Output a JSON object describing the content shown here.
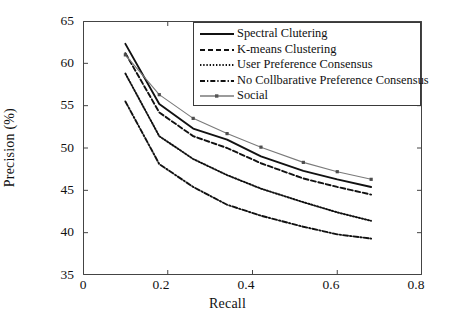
{
  "chart_data": {
    "type": "line",
    "title": "",
    "xlabel": "Recall",
    "ylabel": "Precision (%)",
    "xlim": [
      0,
      0.8
    ],
    "ylim": [
      35,
      65
    ],
    "xticks": [
      "0",
      "0.2",
      "0.4",
      "0.6",
      "0.8"
    ],
    "xtick_values": [
      0,
      0.2,
      0.4,
      0.6,
      0.8
    ],
    "yticks": [
      "35",
      "40",
      "45",
      "50",
      "55",
      "60",
      "65"
    ],
    "ytick_values": [
      35,
      40,
      45,
      50,
      55,
      60,
      65
    ],
    "grid": false,
    "legend_position": "top-right",
    "series": [
      {
        "name": "Spectral Clutering",
        "style": "solid",
        "color": "#111111",
        "x": [
          0.1,
          0.18,
          0.26,
          0.34,
          0.42,
          0.52,
          0.6,
          0.68
        ],
        "y": [
          62.3,
          55.2,
          52.3,
          51.0,
          49.0,
          47.3,
          46.3,
          45.4
        ]
      },
      {
        "name": "K-means Clustering",
        "style": "dashed",
        "color": "#111111",
        "x": [
          0.1,
          0.18,
          0.26,
          0.34,
          0.42,
          0.52,
          0.6,
          0.68
        ],
        "y": [
          61.2,
          54.2,
          51.4,
          50.0,
          48.2,
          46.4,
          45.4,
          44.5
        ]
      },
      {
        "name": "User Preference Consensus",
        "style": "dotted",
        "color": "#111111",
        "x": [
          0.1,
          0.18,
          0.26,
          0.34,
          0.42,
          0.52,
          0.6,
          0.68
        ],
        "y": [
          58.8,
          51.4,
          48.7,
          46.8,
          45.2,
          43.6,
          42.4,
          41.4
        ]
      },
      {
        "name": "No Collbarative Preference Consensus",
        "style": "dashdot",
        "color": "#111111",
        "x": [
          0.1,
          0.18,
          0.26,
          0.34,
          0.42,
          0.52,
          0.6,
          0.68
        ],
        "y": [
          55.5,
          48.1,
          45.4,
          43.3,
          42.0,
          40.7,
          39.8,
          39.3
        ]
      },
      {
        "name": "Social",
        "style": "solid-marker",
        "color": "#7a7a7a",
        "x": [
          0.1,
          0.18,
          0.26,
          0.34,
          0.42,
          0.52,
          0.6,
          0.68
        ],
        "y": [
          61.0,
          56.3,
          53.5,
          51.7,
          50.1,
          48.3,
          47.2,
          46.3
        ]
      }
    ]
  },
  "legend": {
    "items": [
      {
        "label": "Spectral Clutering",
        "style": "solid"
      },
      {
        "label": "K-means Clustering",
        "style": "dashed"
      },
      {
        "label": "User Preference Consensus",
        "style": "dotted"
      },
      {
        "label": "No Collbarative Preference Consensus",
        "style": "dashdot"
      },
      {
        "label": "Social",
        "style": "solid-marker"
      }
    ]
  }
}
